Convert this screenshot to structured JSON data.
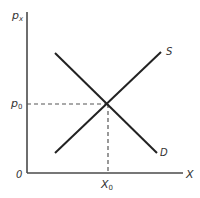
{
  "diagram": {
    "y_axis": {
      "label": "p",
      "label_sub": "x"
    },
    "x_axis": {
      "label": "X"
    },
    "origin_label": "0",
    "equilibrium_price": {
      "label": "p",
      "label_sub": "0"
    },
    "equilibrium_quantity": {
      "label": "X",
      "label_sub": "0"
    },
    "curves": [
      {
        "name": "S",
        "label": "S",
        "description": "supply, upward sloping"
      },
      {
        "name": "D",
        "label": "D",
        "description": "demand, downward sloping"
      }
    ],
    "colors": {
      "line": "#222222",
      "axis": "#4a4a4a",
      "text": "#333333"
    }
  }
}
